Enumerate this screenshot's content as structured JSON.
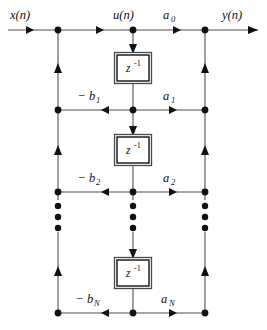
{
  "diagram": {
    "type": "signal-flow-graph",
    "name": "IIR filter direct form II (canonical) structure",
    "signals": {
      "input_label": "x(n)",
      "intermediate_label": "u(n)",
      "output_label": "y(n)"
    },
    "delay_block_label": "z",
    "delay_block_exponent": "-1",
    "delay_blocks": [
      {
        "id": "delay-1",
        "label": "z",
        "exponent": "-1"
      },
      {
        "id": "delay-2",
        "label": "z",
        "exponent": "-1"
      },
      {
        "id": "delay-3",
        "label": "z",
        "exponent": "-1"
      }
    ],
    "feedforward_coefficients": [
      {
        "id": "a0",
        "base": "a",
        "subscript": "0",
        "sign": ""
      },
      {
        "id": "a1",
        "base": "a",
        "subscript": "1",
        "sign": ""
      },
      {
        "id": "a2",
        "base": "a",
        "subscript": "2",
        "sign": ""
      },
      {
        "id": "aN",
        "base": "a",
        "subscript": "N",
        "sign": ""
      }
    ],
    "feedback_coefficients": [
      {
        "id": "b1",
        "base": "b",
        "subscript": "1",
        "sign": "−"
      },
      {
        "id": "b2",
        "base": "b",
        "subscript": "2",
        "sign": "−"
      },
      {
        "id": "bN",
        "base": "b",
        "subscript": "N",
        "sign": "−"
      }
    ],
    "ellipsis": {
      "symbol": "•",
      "count_per_column": 3,
      "columns": [
        "feedback",
        "center",
        "feedforward"
      ]
    },
    "colors": {
      "wire": "#888888",
      "node": "#111111",
      "box_stroke": "#111111",
      "text": "#111111",
      "background": "#ffffff"
    }
  }
}
